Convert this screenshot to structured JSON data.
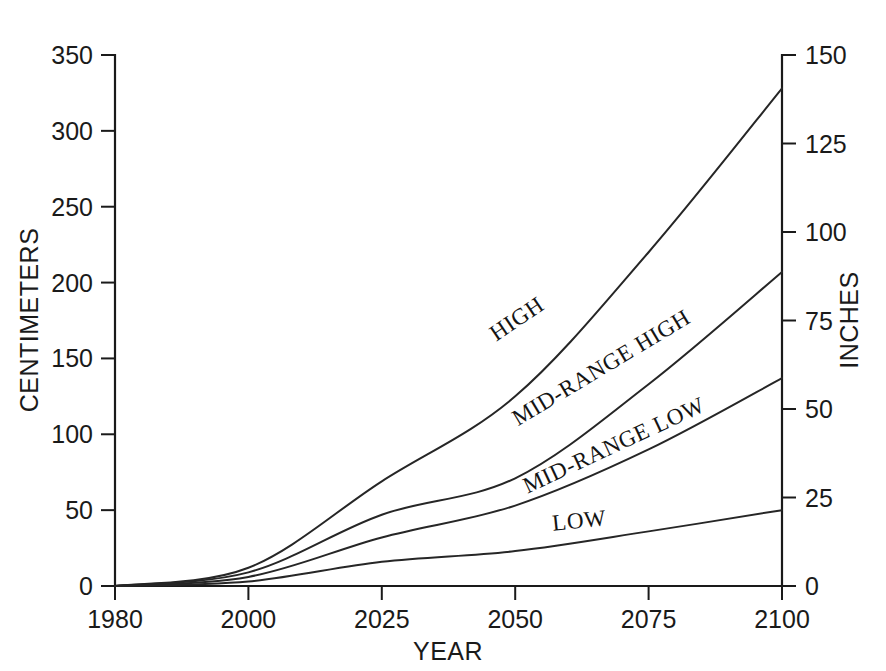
{
  "chart_data": {
    "type": "line",
    "title": "",
    "xlabel": "YEAR",
    "ylabel": "CENTIMETERS",
    "y2label": "INCHES",
    "x_ticks": [
      "1980",
      "2000",
      "2025",
      "2050",
      "2075",
      "2100"
    ],
    "x_tick_values": [
      1980,
      2000,
      2025,
      2050,
      2075,
      2100
    ],
    "y_ticks": [
      "0",
      "50",
      "100",
      "150",
      "200",
      "250",
      "300",
      "350"
    ],
    "y_tick_values": [
      0,
      50,
      100,
      150,
      200,
      250,
      300,
      350
    ],
    "ylim": [
      0,
      350
    ],
    "y2_ticks": [
      "0",
      "25",
      "50",
      "75",
      "100",
      "125",
      "150"
    ],
    "y2_tick_values": [
      0,
      25,
      50,
      75,
      100,
      125,
      150
    ],
    "y2lim": [
      0,
      150
    ],
    "grid": false,
    "legend_position": "inline-curve-labels",
    "x": [
      1980,
      2000,
      2025,
      2050,
      2075,
      2100
    ],
    "series": [
      {
        "name": "HIGH",
        "label": "HIGH",
        "values": [
          0,
          12,
          69,
          125,
          220,
          328
        ],
        "units": "centimeters"
      },
      {
        "name": "MID-RANGE HIGH",
        "label": "MID-RANGE HIGH",
        "values": [
          0,
          9,
          47,
          71,
          133,
          207
        ],
        "units": "centimeters"
      },
      {
        "name": "MID-RANGE LOW",
        "label": "MID-RANGE LOW",
        "values": [
          0,
          6,
          32,
          53,
          90,
          137
        ],
        "units": "centimeters"
      },
      {
        "name": "LOW",
        "label": "LOW",
        "values": [
          0,
          3,
          16,
          23,
          36,
          50
        ],
        "units": "centimeters"
      }
    ],
    "curve_label_positions": [
      {
        "name": "HIGH",
        "x": 521,
        "y": 325,
        "rotation": -34
      },
      {
        "name": "MID-RANGE HIGH",
        "x": 605,
        "y": 374,
        "rotation": -31
      },
      {
        "name": "MID-RANGE LOW",
        "x": 617,
        "y": 452,
        "rotation": -25
      },
      {
        "name": "LOW",
        "x": 580,
        "y": 528,
        "rotation": -6
      }
    ],
    "colors": {
      "line": "#262626",
      "axis": "#1a1a1a",
      "text": "#1a1a1a",
      "background": "#ffffff"
    }
  }
}
